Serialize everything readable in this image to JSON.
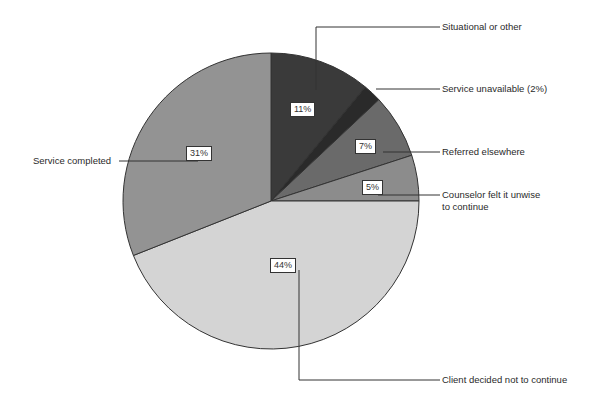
{
  "chart_data": {
    "type": "pie",
    "title": "",
    "start_angle_deg": 0,
    "direction": "clockwise",
    "slices": [
      {
        "label": "Situational or other",
        "value": 11,
        "pct_label": "11%",
        "color": "#3a3a3a"
      },
      {
        "label": "Service unavailable (2%)",
        "value": 2,
        "pct_label": "",
        "color": "#2a2a2a"
      },
      {
        "label": "Referred elsewhere",
        "value": 7,
        "pct_label": "7%",
        "color": "#6a6a6a"
      },
      {
        "label": "Counselor felt it unwise to continue",
        "value": 5,
        "pct_label": "5%",
        "color": "#8c8c8c"
      },
      {
        "label": "Client decided not to continue",
        "value": 44,
        "pct_label": "44%",
        "color": "#d4d4d4"
      },
      {
        "label": "Service completed",
        "value": 31,
        "pct_label": "31%",
        "color": "#939393"
      }
    ]
  },
  "labels": {
    "situational": "Situational or other",
    "unavailable": "Service unavailable (2%)",
    "referred": "Referred elsewhere",
    "counselor_1": "Counselor felt it unwise",
    "counselor_2": "to continue",
    "client": "Client decided not to continue",
    "completed": "Service completed"
  },
  "pcts": {
    "situational": "11%",
    "referred": "7%",
    "counselor": "5%",
    "client": "44%",
    "completed": "31%"
  }
}
